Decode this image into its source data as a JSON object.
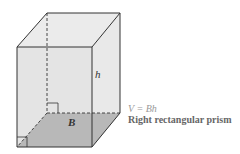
{
  "figure": {
    "title": "Right rectangular prism",
    "formula": "V = Bh",
    "labels": {
      "height": "h",
      "base": "B"
    },
    "colors": {
      "face": "#e6e6e6",
      "base": "#b5b5b5",
      "edge": "#333333"
    }
  }
}
